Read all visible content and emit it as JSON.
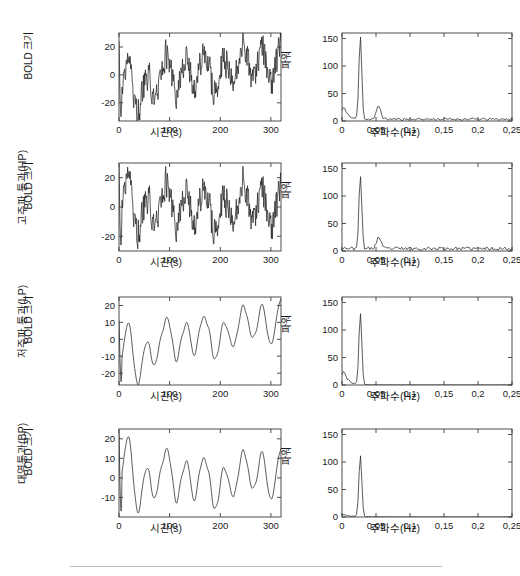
{
  "figure": {
    "rows": [
      {
        "row_label": "",
        "timeseries": {
          "ylabel": "BOLD 크기",
          "xlabel": "시간(s)",
          "yticks": [
            "20",
            "0",
            "-20"
          ],
          "ytick_values": [
            20,
            0,
            -20
          ],
          "xticks": [
            "0",
            "100",
            "200",
            "300"
          ],
          "xtick_values": [
            0,
            100,
            200,
            300
          ],
          "xlim": [
            0,
            320
          ],
          "ylim": [
            -33,
            30
          ]
        },
        "spectrum": {
          "ylabel": "파워",
          "xlabel": "주파수(Hz)",
          "yticks": [
            "150",
            "100",
            "50",
            "0"
          ],
          "ytick_values": [
            150,
            100,
            50,
            0
          ],
          "xticks": [
            "0",
            "0,05",
            "0,1",
            "0,15",
            "0,2",
            "0,25"
          ],
          "xtick_values": [
            0,
            0.05,
            0.1,
            0.15,
            0.2,
            0.25
          ],
          "xlim": [
            0,
            0.25
          ],
          "ylim": [
            0,
            160
          ],
          "peak_frequency": 0.027,
          "peak_power": 150
        }
      },
      {
        "row_label": "고주파 통과(HP)",
        "timeseries": {
          "ylabel": "BOLD 크기",
          "xlabel": "시간(s)",
          "yticks": [
            "20",
            "0",
            "-20"
          ],
          "ytick_values": [
            20,
            0,
            -20
          ],
          "xticks": [
            "0",
            "100",
            "200",
            "300"
          ],
          "xtick_values": [
            0,
            100,
            200,
            300
          ],
          "xlim": [
            0,
            320
          ],
          "ylim": [
            -30,
            30
          ]
        },
        "spectrum": {
          "ylabel": "파워",
          "xlabel": "주파수(Hz)",
          "yticks": [
            "150",
            "100",
            "50",
            "0"
          ],
          "ytick_values": [
            150,
            100,
            50,
            0
          ],
          "xticks": [
            "0",
            "0,05",
            "0,1",
            "0,15",
            "0,2",
            "0,25"
          ],
          "xtick_values": [
            0,
            0.05,
            0.1,
            0.15,
            0.2,
            0.25
          ],
          "xlim": [
            0,
            0.25
          ],
          "ylim": [
            0,
            160
          ],
          "peak_frequency": 0.027,
          "peak_power": 130
        }
      },
      {
        "row_label": "저주파 통과(LP)",
        "timeseries": {
          "ylabel": "BOLD 크기",
          "xlabel": "시간(s)",
          "yticks": [
            "20",
            "10",
            "0",
            "-10",
            "-20"
          ],
          "ytick_values": [
            20,
            10,
            0,
            -10,
            -20
          ],
          "xticks": [
            "0",
            "100",
            "200",
            "300"
          ],
          "xtick_values": [
            0,
            100,
            200,
            300
          ],
          "xlim": [
            0,
            320
          ],
          "ylim": [
            -27,
            25
          ]
        },
        "spectrum": {
          "ylabel": "파워",
          "xlabel": "주파수(Hz)",
          "yticks": [
            "150",
            "100",
            "50",
            "0"
          ],
          "ytick_values": [
            150,
            100,
            50,
            0
          ],
          "xticks": [
            "0",
            "0,05",
            "0,1",
            "0,15",
            "0,2",
            "0,25"
          ],
          "xtick_values": [
            0,
            0.05,
            0.1,
            0.15,
            0.2,
            0.25
          ],
          "xlim": [
            0,
            0.25
          ],
          "ylim": [
            0,
            160
          ],
          "peak_frequency": 0.027,
          "peak_power": 130
        }
      },
      {
        "row_label": "대역통과(BP)",
        "timeseries": {
          "ylabel": "BOLD 크기",
          "xlabel": "시간(s)",
          "yticks": [
            "20",
            "10",
            "0",
            "-10"
          ],
          "ytick_values": [
            20,
            10,
            0,
            -10
          ],
          "xticks": [
            "0",
            "100",
            "200",
            "300"
          ],
          "xtick_values": [
            0,
            100,
            200,
            300
          ],
          "xlim": [
            0,
            320
          ],
          "ylim": [
            -20,
            25
          ]
        },
        "spectrum": {
          "ylabel": "파워",
          "xlabel": "주파수(Hz)",
          "yticks": [
            "150",
            "100",
            "50",
            "0"
          ],
          "ytick_values": [
            150,
            100,
            50,
            0
          ],
          "xticks": [
            "0",
            "0,05",
            "0,1",
            "0,15",
            "0,2",
            "0,25"
          ],
          "xtick_values": [
            0,
            0.05,
            0.1,
            0.15,
            0.2,
            0.25
          ],
          "xlim": [
            0,
            0.25
          ],
          "ylim": [
            0,
            160
          ],
          "peak_frequency": 0.027,
          "peak_power": 112
        }
      }
    ]
  },
  "chart_data": [
    {
      "type": "line",
      "title": "원신호 BOLD 시계열",
      "xlabel": "시간(s)",
      "ylabel": "BOLD 크기",
      "xlim": [
        0,
        320
      ],
      "ylim": [
        -33,
        30
      ],
      "grid": false,
      "series": [
        {
          "name": "raw",
          "x": [
            0,
            4,
            8,
            12,
            16,
            20,
            24,
            28,
            32,
            36,
            40,
            44,
            48,
            52,
            56,
            60,
            64,
            68,
            72,
            76,
            80,
            84,
            88,
            92,
            96,
            100,
            104,
            108,
            112,
            116,
            120,
            124,
            128,
            132,
            136,
            140,
            144,
            148,
            152,
            156,
            160,
            164,
            168,
            172,
            176,
            180,
            184,
            188,
            192,
            196,
            200,
            204,
            208,
            212,
            216,
            220,
            224,
            228,
            232,
            236,
            240,
            244,
            248,
            252,
            256,
            260,
            264,
            268,
            272,
            276,
            280,
            284,
            288,
            292,
            296,
            300,
            304,
            308,
            312,
            316,
            320
          ],
          "values": [
            22,
            -6,
            -24,
            -31,
            -20,
            -26,
            -14,
            -8,
            2,
            10,
            13,
            8,
            1,
            -4,
            -12,
            -19,
            -22,
            -6,
            1,
            -3,
            -11,
            -6,
            -13,
            -5,
            -9,
            -2,
            -8,
            -14,
            -10,
            -4,
            10,
            12,
            6,
            14,
            9,
            3,
            11,
            5,
            12,
            6,
            -1,
            -9,
            -14,
            -21,
            -12,
            -6,
            -9,
            -2,
            6,
            9,
            13,
            4,
            -6,
            -14,
            -8,
            -18,
            -7,
            -12,
            -2,
            7,
            11,
            5,
            -2,
            -12,
            -20,
            -13,
            -5,
            4,
            13,
            18,
            23,
            14,
            20,
            8,
            -2,
            -9,
            -3,
            4,
            12,
            17,
            13
          ]
        }
      ]
    },
    {
      "type": "line",
      "title": "원신호 파워 스펙트럼",
      "xlabel": "주파수(Hz)",
      "ylabel": "파워",
      "xlim": [
        0,
        0.25
      ],
      "ylim": [
        0,
        160
      ],
      "grid": false,
      "series": [
        {
          "name": "raw-spectrum",
          "peak_frequency": 0.027,
          "peak_power": 150,
          "low_frequency_shoulder": 16,
          "broadband_floor": 3
        }
      ]
    },
    {
      "type": "line",
      "title": "고주파 통과(HP) BOLD 시계열",
      "xlabel": "시간(s)",
      "ylabel": "BOLD 크기",
      "xlim": [
        0,
        320
      ],
      "ylim": [
        -30,
        30
      ],
      "grid": false,
      "series": [
        {
          "name": "high-pass",
          "values": [
            26,
            -8,
            -20,
            -24,
            -16,
            -22,
            -10,
            -4,
            6,
            15,
            20,
            14,
            4,
            -2,
            -10,
            -16,
            -20,
            -4,
            2,
            -2,
            -10,
            -4,
            -12,
            -3,
            -8,
            0,
            -7,
            -13,
            -9,
            -2,
            12,
            14,
            7,
            16,
            10,
            4,
            12,
            6,
            13,
            7,
            0,
            -8,
            -13,
            -20,
            -11,
            -5,
            -8,
            -1,
            7,
            10,
            14,
            5,
            -5,
            -13,
            -7,
            -17,
            -6,
            -11,
            -1,
            8,
            12,
            6,
            -1,
            -11,
            -19,
            -12,
            -4,
            5,
            14,
            19,
            22,
            13,
            19,
            7,
            -3,
            -10,
            -4,
            3,
            11,
            16,
            2
          ]
        }
      ]
    },
    {
      "type": "line",
      "title": "고주파 통과(HP) 파워 스펙트럼",
      "xlabel": "주파수(Hz)",
      "ylabel": "파워",
      "xlim": [
        0,
        0.25
      ],
      "ylim": [
        0,
        160
      ],
      "grid": false,
      "series": [
        {
          "name": "high-pass-spectrum",
          "peak_frequency": 0.027,
          "peak_power": 130,
          "low_frequency_shoulder": 2,
          "broadband_floor": 4
        }
      ]
    },
    {
      "type": "line",
      "title": "저주파 통과(LP) BOLD 시계열",
      "xlabel": "시간(s)",
      "ylabel": "BOLD 크기",
      "xlim": [
        0,
        320
      ],
      "ylim": [
        -27,
        25
      ],
      "grid": false,
      "series": [
        {
          "name": "low-pass",
          "values": [
            11,
            -13,
            -25,
            -18,
            -14,
            -16,
            -11,
            -2,
            6,
            10,
            9,
            1,
            -9,
            -13,
            -11,
            -5,
            -2,
            1,
            -4,
            -6,
            -2,
            3,
            1,
            -3,
            -4,
            0,
            5,
            10,
            13,
            7,
            -2,
            -4,
            0,
            3,
            5,
            3,
            -3,
            -8,
            -12,
            -13,
            -11,
            -7,
            0,
            6,
            10,
            11,
            8,
            2,
            -3,
            -6,
            -4,
            -2,
            -6,
            -11,
            -14,
            -10,
            -3,
            5,
            12,
            17,
            20,
            18,
            13,
            8,
            4,
            9,
            14,
            16,
            12,
            8,
            14,
            20,
            22
          ]
        }
      ]
    },
    {
      "type": "line",
      "title": "저주파 통과(LP) 파워 스펙트럼",
      "xlabel": "주파수(Hz)",
      "ylabel": "파워",
      "xlim": [
        0,
        0.25
      ],
      "ylim": [
        0,
        160
      ],
      "grid": false,
      "series": [
        {
          "name": "low-pass-spectrum",
          "peak_frequency": 0.027,
          "peak_power": 130,
          "low_frequency_shoulder": 18,
          "broadband_floor": 0
        }
      ]
    },
    {
      "type": "line",
      "title": "대역통과(BP) BOLD 시계열",
      "xlabel": "시간(s)",
      "ylabel": "BOLD 크기",
      "xlim": [
        0,
        320
      ],
      "ylim": [
        -20,
        25
      ],
      "grid": false,
      "series": [
        {
          "name": "band-pass",
          "values": [
            23,
            -8,
            -17,
            -15,
            -12,
            -13,
            -10,
            0,
            9,
            17,
            19,
            12,
            2,
            -6,
            -9,
            -8,
            -3,
            2,
            -2,
            -5,
            0,
            4,
            1,
            -3,
            -5,
            1,
            6,
            11,
            13,
            6,
            -3,
            -6,
            -2,
            2,
            4,
            2,
            -4,
            -9,
            -13,
            -14,
            -12,
            -8,
            -1,
            6,
            11,
            12,
            8,
            1,
            -4,
            -7,
            -5,
            -3,
            -7,
            -12,
            -16,
            -11,
            -4,
            5,
            12,
            16,
            15,
            10,
            5,
            2,
            6,
            10,
            12,
            8,
            4,
            9,
            6
          ]
        }
      ]
    },
    {
      "type": "line",
      "title": "대역통과(BP) 파워 스펙트럼",
      "xlabel": "주파수(Hz)",
      "ylabel": "파워",
      "xlim": [
        0,
        0.25
      ],
      "ylim": [
        0,
        160
      ],
      "grid": false,
      "series": [
        {
          "name": "band-pass-spectrum",
          "peak_frequency": 0.027,
          "peak_power": 112,
          "low_frequency_shoulder": 4,
          "broadband_floor": 1
        }
      ]
    }
  ]
}
